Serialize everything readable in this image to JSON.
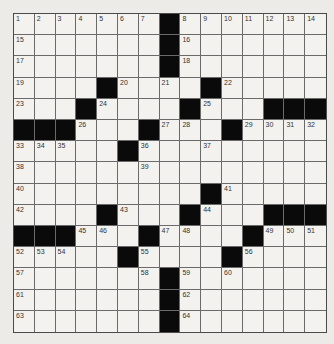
{
  "puzzle": {
    "type": "crossword",
    "rows": 15,
    "cols": 15,
    "colors": {
      "background": "#ecebe8",
      "cell": "#f3f2ef",
      "block": "#0a0a0a",
      "line": "#6a6a6a"
    },
    "layout": [
      "1234567#8901234",
      ".......#.......",
      ".......#.......",
      "....#...#......",
      "...#....#...###",
      "###...#...#....",
      ".....#.........",
      "...............",
      ".........#.....",
      "....#...#...###",
      "###...#....#...",
      ".....#....#....",
      ".......#.......",
      ".......#.......",
      ".......#......."
    ],
    "blocks": [
      [
        0,
        7
      ],
      [
        1,
        7
      ],
      [
        2,
        7
      ],
      [
        3,
        4
      ],
      [
        3,
        9
      ],
      [
        4,
        3
      ],
      [
        4,
        8
      ],
      [
        4,
        12
      ],
      [
        4,
        13
      ],
      [
        4,
        14
      ],
      [
        5,
        0
      ],
      [
        5,
        1
      ],
      [
        5,
        2
      ],
      [
        5,
        6
      ],
      [
        5,
        10
      ],
      [
        6,
        5
      ],
      [
        8,
        9
      ],
      [
        9,
        4
      ],
      [
        9,
        8
      ],
      [
        9,
        12
      ],
      [
        9,
        13
      ],
      [
        9,
        14
      ],
      [
        10,
        0
      ],
      [
        10,
        1
      ],
      [
        10,
        2
      ],
      [
        10,
        6
      ],
      [
        10,
        11
      ],
      [
        11,
        5
      ],
      [
        11,
        10
      ],
      [
        12,
        7
      ],
      [
        13,
        7
      ],
      [
        14,
        7
      ]
    ],
    "numbers": [
      {
        "r": 0,
        "c": 0,
        "n": "1"
      },
      {
        "r": 0,
        "c": 1,
        "n": "2"
      },
      {
        "r": 0,
        "c": 2,
        "n": "3"
      },
      {
        "r": 0,
        "c": 3,
        "n": "4"
      },
      {
        "r": 0,
        "c": 4,
        "n": "5"
      },
      {
        "r": 0,
        "c": 5,
        "n": "6"
      },
      {
        "r": 0,
        "c": 6,
        "n": "7"
      },
      {
        "r": 0,
        "c": 8,
        "n": "8"
      },
      {
        "r": 0,
        "c": 9,
        "n": "9"
      },
      {
        "r": 0,
        "c": 10,
        "n": "10"
      },
      {
        "r": 0,
        "c": 11,
        "n": "11"
      },
      {
        "r": 0,
        "c": 12,
        "n": "12"
      },
      {
        "r": 0,
        "c": 13,
        "n": "13"
      },
      {
        "r": 0,
        "c": 14,
        "n": "14"
      },
      {
        "r": 1,
        "c": 0,
        "n": "15"
      },
      {
        "r": 1,
        "c": 8,
        "n": "16"
      },
      {
        "r": 2,
        "c": 0,
        "n": "17"
      },
      {
        "r": 2,
        "c": 8,
        "n": "18"
      },
      {
        "r": 3,
        "c": 0,
        "n": "19"
      },
      {
        "r": 3,
        "c": 5,
        "n": "20"
      },
      {
        "r": 3,
        "c": 7,
        "n": "21"
      },
      {
        "r": 3,
        "c": 10,
        "n": "22"
      },
      {
        "r": 4,
        "c": 0,
        "n": "23"
      },
      {
        "r": 4,
        "c": 4,
        "n": "24"
      },
      {
        "r": 4,
        "c": 9,
        "n": "25"
      },
      {
        "r": 5,
        "c": 3,
        "n": "26"
      },
      {
        "r": 5,
        "c": 7,
        "n": "27"
      },
      {
        "r": 5,
        "c": 8,
        "n": "28"
      },
      {
        "r": 5,
        "c": 11,
        "n": "29"
      },
      {
        "r": 5,
        "c": 12,
        "n": "30"
      },
      {
        "r": 5,
        "c": 13,
        "n": "31"
      },
      {
        "r": 5,
        "c": 14,
        "n": "32"
      },
      {
        "r": 6,
        "c": 0,
        "n": "33"
      },
      {
        "r": 6,
        "c": 1,
        "n": "34"
      },
      {
        "r": 6,
        "c": 2,
        "n": "35"
      },
      {
        "r": 6,
        "c": 6,
        "n": "36"
      },
      {
        "r": 6,
        "c": 9,
        "n": "37"
      },
      {
        "r": 7,
        "c": 0,
        "n": "38"
      },
      {
        "r": 7,
        "c": 6,
        "n": "39"
      },
      {
        "r": 8,
        "c": 0,
        "n": "40"
      },
      {
        "r": 8,
        "c": 10,
        "n": "41"
      },
      {
        "r": 9,
        "c": 0,
        "n": "42"
      },
      {
        "r": 9,
        "c": 5,
        "n": "43"
      },
      {
        "r": 9,
        "c": 9,
        "n": "44"
      },
      {
        "r": 10,
        "c": 3,
        "n": "45"
      },
      {
        "r": 10,
        "c": 4,
        "n": "46"
      },
      {
        "r": 10,
        "c": 7,
        "n": "47"
      },
      {
        "r": 10,
        "c": 8,
        "n": "48"
      },
      {
        "r": 10,
        "c": 12,
        "n": "49"
      },
      {
        "r": 10,
        "c": 13,
        "n": "50"
      },
      {
        "r": 10,
        "c": 14,
        "n": "51"
      },
      {
        "r": 11,
        "c": 0,
        "n": "52"
      },
      {
        "r": 11,
        "c": 1,
        "n": "53"
      },
      {
        "r": 11,
        "c": 2,
        "n": "54"
      },
      {
        "r": 11,
        "c": 6,
        "n": "55"
      },
      {
        "r": 11,
        "c": 11,
        "n": "56"
      },
      {
        "r": 12,
        "c": 0,
        "n": "57"
      },
      {
        "r": 12,
        "c": 6,
        "n": "58"
      },
      {
        "r": 12,
        "c": 8,
        "n": "59"
      },
      {
        "r": 12,
        "c": 10,
        "n": "60"
      },
      {
        "r": 13,
        "c": 0,
        "n": "61"
      },
      {
        "r": 13,
        "c": 8,
        "n": "62"
      },
      {
        "r": 14,
        "c": 0,
        "n": "63"
      },
      {
        "r": 14,
        "c": 8,
        "n": "64"
      }
    ]
  }
}
